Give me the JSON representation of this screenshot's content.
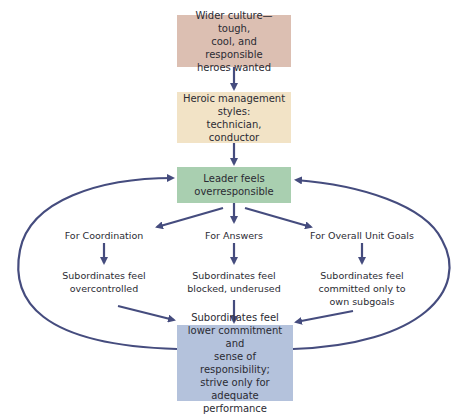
{
  "colors": {
    "arrow": "#454c7e",
    "box_culture": "#dcbfb2",
    "box_styles": "#f2e3c6",
    "box_leader": "#a9cfb0",
    "box_outcome": "#b4c2dc"
  },
  "boxes": {
    "culture": {
      "lines": [
        "Wider culture—tough,",
        "cool, and responsible",
        "heroes wanted"
      ]
    },
    "styles": {
      "lines": [
        "Heroic management",
        "styles:",
        "technician, conductor"
      ]
    },
    "leader": {
      "lines": [
        "Leader feels",
        "overresponsible"
      ]
    },
    "outcome": {
      "lines": [
        "Subordinates feel",
        "lower commitment and",
        "sense of responsibility;",
        "strive only for",
        "adequate performance"
      ]
    }
  },
  "branches": [
    {
      "heading": "For Coordination",
      "result": [
        "Subordinates feel",
        "overcontrolled"
      ]
    },
    {
      "heading": "For Answers",
      "result": [
        "Subordinates feel",
        "blocked, underused"
      ]
    },
    {
      "heading": "For Overall Unit Goals",
      "result": [
        "Subordinates feel",
        "committed only to",
        "own subgoals"
      ]
    }
  ]
}
